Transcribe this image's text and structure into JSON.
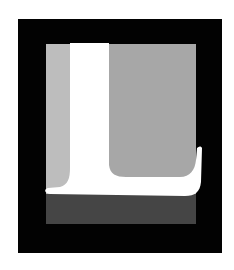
{
  "image": {
    "subject": "Large white serif letter L on layered gray panels inside a black square frame",
    "letter": "L",
    "colors": {
      "background": "#ffffff",
      "frame": "#020202",
      "panel_light": "#bdbdbd",
      "panel_mid": "#a7a7a7",
      "panel_dark": "#454545",
      "letter": "#ffffff"
    }
  }
}
